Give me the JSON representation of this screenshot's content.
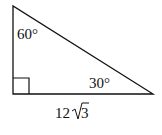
{
  "diagram": {
    "type": "right-triangle",
    "vertices": {
      "top": [
        13,
        6
      ],
      "right_angle": [
        13,
        94
      ],
      "right": [
        153,
        94
      ]
    },
    "angles": {
      "top": "60°",
      "right": "30°",
      "bottom_left": "90°"
    },
    "labels": {
      "top_angle": "60°",
      "right_angle_label": "30°",
      "base_coefficient": "12",
      "base_radicand": "3",
      "base_length": "12√3"
    },
    "colors": {
      "stroke": "#111111",
      "background": "#ffffff"
    }
  }
}
